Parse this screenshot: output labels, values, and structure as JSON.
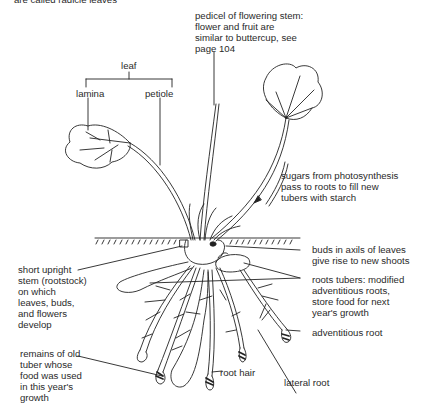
{
  "diagram": {
    "title_fragment": "are called radicle leaves",
    "labels": {
      "leaf": "leaf",
      "lamina": "lamina",
      "petiole": "petiole",
      "pedicel": "pedicel of flowering stem:\nflower and fruit are\nsimilar to buttercup, see\npage 104",
      "sugars": "sugars from photosynthesis\npass to roots to fill new\ntubers with starch",
      "buds": "buds in axils of leaves\ngive rise to new shoots",
      "rootstock": "short upright\nstem (rootstock)\non which\nleaves, buds,\nand flowers\ndevelop",
      "root_tubers": "roots tubers: modified\nadventitious roots,\nstore food for next\nyear's growth",
      "adventitious_root": "adventitious root",
      "old_tuber": "remains of old\ntuber whose\nfood was used\nin this year's\ngrowth",
      "root_hair": "root hair",
      "lateral_root": "lateral root"
    }
  }
}
